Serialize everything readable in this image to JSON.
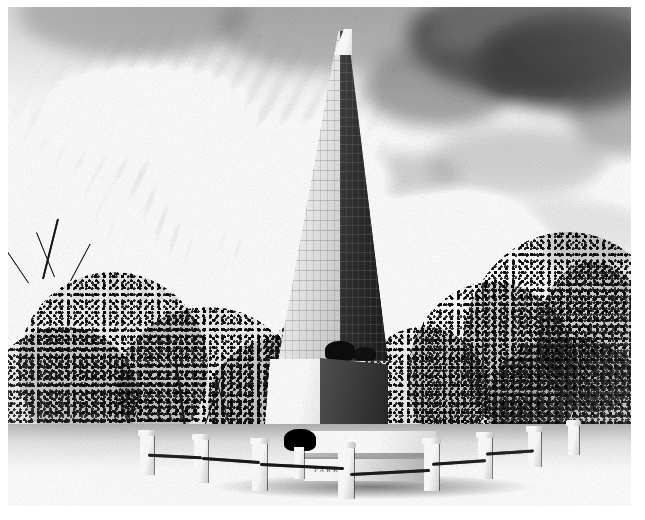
{
  "image": {
    "kind": "photograph",
    "rendering": "halftone-dither-black-and-white",
    "subject_title": "Obelisk monument (Cleopatra's Needle)",
    "caption": "",
    "alt_text": "Black-and-white halftone photograph of a tall stone obelisk rising against a sky of wispy cirrus and dark cumulus clouds, framed by leafy trees, with a low stone-post and rail fence around a grass lawn in the foreground.",
    "colors": {
      "paper": "#ffffff",
      "sky_light": "#f3f3f3",
      "sky_mid": "#dcdcdc",
      "cloud_dark": "#5a5a5a",
      "obelisk_light_face": "#d6d6d6",
      "obelisk_dark_face": "#4a4a4a",
      "foliage": "#3a3a3a",
      "lawn": "#dedede",
      "stone": "#e8e8e8"
    },
    "frame": {
      "left": 8,
      "top": 7,
      "width": 623,
      "height": 499
    }
  },
  "scene": {
    "sky": {
      "label": "Sky",
      "cirrus_label": "Wispy cirrus streaks",
      "cumulus_label": "Dark cumulus mass"
    },
    "obelisk": {
      "label": "Obelisk",
      "lit_face_label": "Sunlit west face",
      "shadow_face_label": "Shaded face",
      "inscription_label": "Hieroglyphic inscription",
      "pyramidion_label": "Pyramidion (apex)"
    },
    "pedestal": {
      "label": "Granite pedestal",
      "crab_label": "Bronze crab support"
    },
    "foreground": {
      "lawn_label": "Lawn",
      "fence_label": "Stone post and rail fence",
      "urn_label": "Stone urn finial",
      "slab_label": "Inscribed stone bench slab",
      "plaque_text": "PARK",
      "shadow_label": "Cast shadow"
    },
    "trees": {
      "left_label": "Left tree canopy",
      "right_label": "Right tree canopy",
      "bare_branch_label": "Bare branches"
    }
  }
}
